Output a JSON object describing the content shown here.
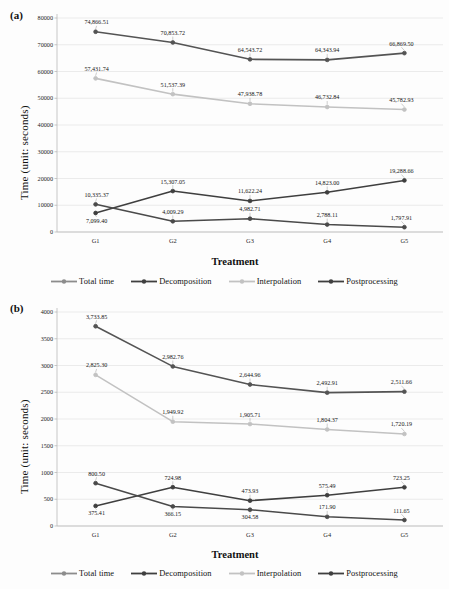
{
  "figure": {
    "background": "#fdfdfd",
    "panels": [
      "(a)",
      "(b)"
    ]
  },
  "colors": {
    "total_time": "#8c8c8c",
    "decomposition": "#545454",
    "interpolation": "#c2c2c2",
    "postprocessing": "#3f3f3f",
    "grid": "#e3e3e3",
    "axis": "#b9b9b9",
    "text": "#1a1a1a"
  },
  "panel_a": {
    "tag": "(a)",
    "chart_data": {
      "type": "line",
      "title": "",
      "xlabel": "Treatment",
      "ylabel": "Time (unit: seconds)",
      "categories": [
        "G1",
        "G2",
        "G3",
        "G4",
        "G5"
      ],
      "ylim": [
        0,
        80000
      ],
      "yticks": [
        0,
        10000,
        20000,
        30000,
        40000,
        50000,
        60000,
        70000,
        80000
      ],
      "ytick_labels": [
        "0",
        "10000",
        "20000",
        "30000",
        "40000",
        "50000",
        "60000",
        "70000",
        "80000"
      ],
      "grid": true,
      "legend_position": "bottom",
      "series": [
        {
          "name": "Total time",
          "color": "#545454",
          "values": [
            74866.51,
            70853.72,
            64543.72,
            64343.94,
            66869.5
          ],
          "labels": [
            "74,866.51",
            "70,853.72",
            "64,543.72",
            "64,343.94",
            "66,869.50"
          ],
          "label_pos": [
            "above",
            "above",
            "above",
            "above",
            "above"
          ]
        },
        {
          "name": "Interpolation",
          "color": "#c2c2c2",
          "values": [
            57431.74,
            51537.39,
            47938.78,
            46732.84,
            45782.93
          ],
          "labels": [
            "57,431.74",
            "51,537.39",
            "47,938.78",
            "46,732.84",
            "45,782.93"
          ],
          "label_pos": [
            "above",
            "above",
            "above",
            "above",
            "above"
          ]
        },
        {
          "name": "Decomposition",
          "color": "#3f3f3f",
          "values": [
            7099.4,
            15307.05,
            11622.24,
            14823.0,
            19288.66
          ],
          "labels": [
            "7,099.40",
            "15,307.05",
            "11,622.24",
            "14,823.00",
            "19,288.66"
          ],
          "label_pos": [
            "below",
            "above",
            "above",
            "above",
            "above"
          ]
        },
        {
          "name": "Postprocessing",
          "color": "#4a4a4a",
          "values": [
            10335.37,
            4009.29,
            4982.71,
            2788.11,
            1797.91
          ],
          "labels": [
            "10,335.37",
            "4,009.29",
            "4,982.71",
            "2,788.11",
            "1,797.91"
          ],
          "label_pos": [
            "above",
            "above",
            "above",
            "above",
            "above"
          ]
        }
      ]
    },
    "legend": [
      {
        "label": "Total time",
        "color": "#8c8c8c"
      },
      {
        "label": "Decomposition",
        "color": "#3f3f3f"
      },
      {
        "label": "Interpolation",
        "color": "#c2c2c2"
      },
      {
        "label": "Postprocessing",
        "color": "#3f3f3f"
      }
    ]
  },
  "panel_b": {
    "tag": "(b)",
    "chart_data": {
      "type": "line",
      "title": "",
      "xlabel": "Treatment",
      "ylabel": "Time (unit: seconds)",
      "categories": [
        "G1",
        "G2",
        "G3",
        "G4",
        "G5"
      ],
      "ylim": [
        0,
        4000
      ],
      "yticks": [
        0,
        500,
        1000,
        1500,
        2000,
        2500,
        3000,
        3500,
        4000
      ],
      "ytick_labels": [
        "0",
        "500",
        "1000",
        "1500",
        "2000",
        "2500",
        "3000",
        "3500",
        "4000"
      ],
      "grid": true,
      "legend_position": "bottom",
      "series": [
        {
          "name": "Total time",
          "color": "#545454",
          "values": [
            3733.85,
            2982.76,
            2644.96,
            2492.91,
            2511.66
          ],
          "labels": [
            "3,733.85",
            "2,982.76",
            "2,644.96",
            "2,492.91",
            "2,511.66"
          ],
          "label_pos": [
            "above",
            "above",
            "above",
            "above",
            "above"
          ]
        },
        {
          "name": "Interpolation",
          "color": "#c2c2c2",
          "values": [
            2825.3,
            1949.92,
            1905.71,
            1804.37,
            1720.19
          ],
          "labels": [
            "2,825.30",
            "1,949.92",
            "1,905.71",
            "1,804.37",
            "1,720.19"
          ],
          "label_pos": [
            "above",
            "above",
            "above",
            "above",
            "above"
          ]
        },
        {
          "name": "Decomposition",
          "color": "#3f3f3f",
          "values": [
            375.41,
            724.98,
            473.93,
            575.49,
            723.25
          ],
          "labels": [
            "375.41",
            "724.98",
            "473.93",
            "575.49",
            "723.25"
          ],
          "label_pos": [
            "below",
            "above",
            "above",
            "above",
            "above"
          ]
        },
        {
          "name": "Postprocessing",
          "color": "#4a4a4a",
          "values": [
            800.5,
            366.15,
            304.58,
            171.9,
            111.65
          ],
          "labels": [
            "800.50",
            "366.15",
            "304.58",
            "171.90",
            "111.65"
          ],
          "label_pos": [
            "above",
            "below",
            "below",
            "above",
            "above"
          ]
        }
      ]
    },
    "legend": [
      {
        "label": "Total time",
        "color": "#8c8c8c"
      },
      {
        "label": "Decomposition",
        "color": "#3f3f3f"
      },
      {
        "label": "Interpolation",
        "color": "#c2c2c2"
      },
      {
        "label": "Postprocessing",
        "color": "#3f3f3f"
      }
    ]
  }
}
